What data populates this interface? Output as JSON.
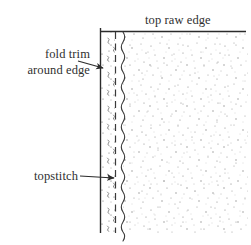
{
  "figure": {
    "kind": "sewing-construction-diagram",
    "background_color": "#ffffff",
    "ink_color": "#2b2b2b"
  },
  "labels": {
    "top_raw_edge": "top raw edge",
    "fold_trim_line1": "fold trim",
    "fold_trim_line2": "around edge",
    "topstitch": "topstitch"
  },
  "geometry": {
    "top_edge_line": {
      "x1": 100,
      "y": 31,
      "x2": 246
    },
    "fold_edge_line": {
      "x": 100,
      "y1": 28,
      "y2": 233
    },
    "dashed_line": {
      "x": 115,
      "y1": 31,
      "y2": 233
    },
    "wavy_stitch_line": {
      "x": 123,
      "y1": 31,
      "y2": 233
    },
    "fold_strip": {
      "x1": 100,
      "x2": 115,
      "y1": 31,
      "y2": 233
    },
    "fabric_field": {
      "x1": 123,
      "x2": 248,
      "y1": 31,
      "y2": 233
    }
  },
  "leaders": {
    "fold_trim_arrow": {
      "x1": 78,
      "y1": 61,
      "x2": 106,
      "y2": 68
    },
    "topstitch_arrow": {
      "x1": 80,
      "y1": 176,
      "x2": 117,
      "y2": 178
    }
  }
}
